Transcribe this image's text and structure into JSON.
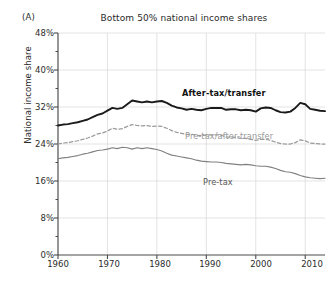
{
  "panel": {
    "label": "(A)"
  },
  "title": "Bottom 50% national income shares",
  "axes": {
    "ylabel": "National income share",
    "yticks": [
      "0%",
      "8%",
      "16%",
      "24%",
      "32%",
      "40%",
      "48%"
    ],
    "ytick_values": [
      0,
      8,
      16,
      24,
      32,
      40,
      48
    ],
    "yminor_values": [
      4,
      12,
      20,
      28,
      36,
      44
    ],
    "xticks": [
      "1960",
      "1970",
      "1980",
      "1990",
      "2000",
      "2010"
    ],
    "xtick_values": [
      1960,
      1970,
      1980,
      1990,
      2000,
      2010
    ],
    "xlim": [
      1960,
      2014
    ],
    "ylim": [
      0,
      48
    ]
  },
  "colors": {
    "after_tax": "#1a1a1a",
    "pre_tax_after_transfer": "#9a9a9a",
    "pre_tax": "#808080",
    "grid": "#d7d7d7",
    "axis": "#4a4a4a",
    "background": "#ffffff"
  },
  "series_labels": {
    "after_tax": "After-tax/transfer",
    "pre_tax_after_transfer": "Pre-tax/after-transfer",
    "pre_tax": "Pre-tax"
  },
  "chart_data": {
    "type": "line",
    "title": "Bottom 50% national income shares",
    "xlabel": "",
    "ylabel": "National income share",
    "xlim": [
      1960,
      2014
    ],
    "ylim": [
      0,
      48
    ],
    "grid": "vertical-decades-and-horizontal-majors",
    "legend": "inline-labels",
    "x": [
      1960,
      1961,
      1962,
      1963,
      1964,
      1965,
      1966,
      1967,
      1968,
      1969,
      1970,
      1971,
      1972,
      1973,
      1974,
      1975,
      1976,
      1977,
      1978,
      1979,
      1980,
      1981,
      1982,
      1983,
      1984,
      1985,
      1986,
      1987,
      1988,
      1989,
      1990,
      1991,
      1992,
      1993,
      1994,
      1995,
      1996,
      1997,
      1998,
      1999,
      2000,
      2001,
      2002,
      2003,
      2004,
      2005,
      2006,
      2007,
      2008,
      2009,
      2010,
      2011,
      2012,
      2013,
      2014
    ],
    "series": [
      {
        "name": "After-tax/transfer",
        "style": "solid-bold",
        "color": "#1a1a1a",
        "values": [
          28.0,
          28.2,
          28.3,
          28.5,
          28.7,
          29.0,
          29.3,
          29.8,
          30.3,
          30.6,
          31.2,
          31.8,
          31.6,
          31.8,
          32.6,
          33.4,
          33.2,
          33.0,
          33.2,
          33.0,
          33.2,
          33.3,
          32.9,
          32.3,
          31.9,
          31.7,
          31.4,
          31.6,
          31.4,
          31.3,
          31.6,
          31.8,
          31.8,
          31.8,
          31.4,
          31.5,
          31.5,
          31.3,
          31.4,
          31.3,
          31.0,
          31.7,
          31.9,
          31.8,
          31.3,
          30.9,
          30.8,
          31.0,
          31.8,
          32.9,
          32.6,
          31.6,
          31.4,
          31.2,
          31.1
        ]
      },
      {
        "name": "Pre-tax/after-transfer",
        "style": "dashed",
        "color": "#9a9a9a",
        "values": [
          24.0,
          24.2,
          24.3,
          24.5,
          24.7,
          25.0,
          25.3,
          25.7,
          26.2,
          26.4,
          26.8,
          27.4,
          27.2,
          27.3,
          27.8,
          28.2,
          28.0,
          27.9,
          28.0,
          27.8,
          27.9,
          27.8,
          27.4,
          26.9,
          26.5,
          26.3,
          26.0,
          26.1,
          25.9,
          25.8,
          25.9,
          26.0,
          26.0,
          25.9,
          25.5,
          25.5,
          25.4,
          25.2,
          25.2,
          25.0,
          24.8,
          25.0,
          25.0,
          24.8,
          24.4,
          24.1,
          24.0,
          24.0,
          24.3,
          24.9,
          24.7,
          24.2,
          24.1,
          24.0,
          24.0
        ]
      },
      {
        "name": "Pre-tax",
        "style": "solid-thin",
        "color": "#808080",
        "values": [
          20.8,
          21.0,
          21.1,
          21.3,
          21.5,
          21.8,
          22.0,
          22.3,
          22.6,
          22.7,
          22.9,
          23.2,
          23.0,
          23.3,
          23.2,
          22.9,
          23.2,
          23.0,
          23.2,
          23.0,
          22.8,
          22.5,
          22.0,
          21.6,
          21.4,
          21.2,
          21.0,
          20.8,
          20.5,
          20.3,
          20.2,
          20.1,
          20.1,
          20.0,
          19.8,
          19.7,
          19.6,
          19.5,
          19.6,
          19.5,
          19.3,
          19.2,
          19.2,
          19.0,
          18.7,
          18.3,
          18.0,
          17.9,
          17.6,
          17.2,
          16.9,
          16.7,
          16.6,
          16.5,
          16.6
        ]
      }
    ]
  }
}
